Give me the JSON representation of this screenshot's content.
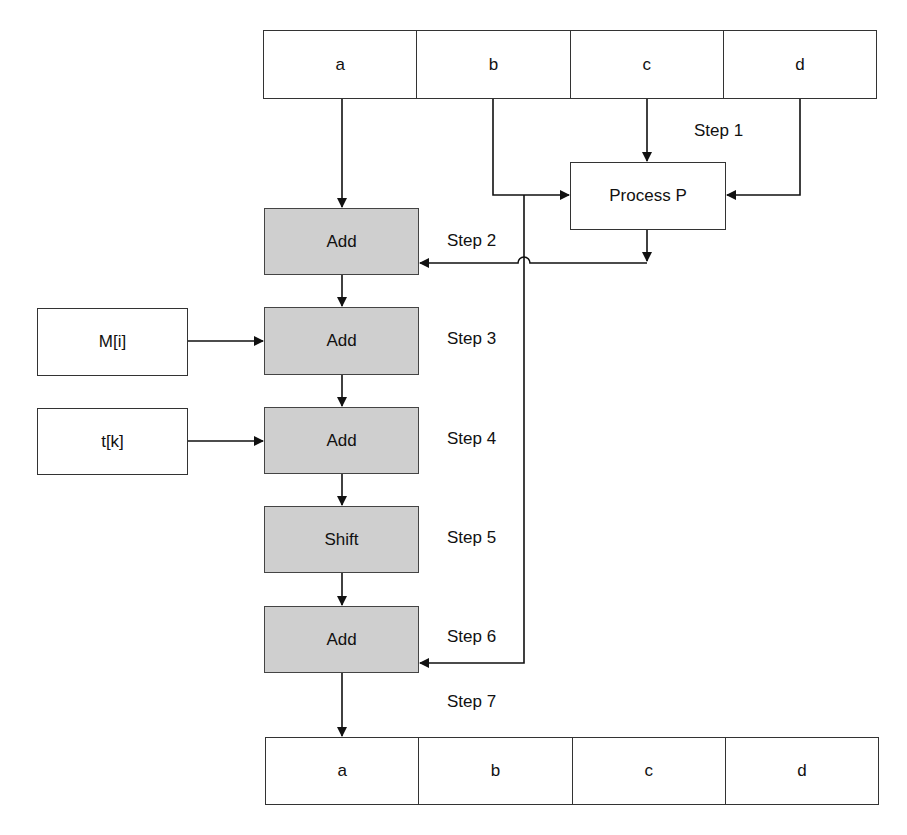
{
  "input_register": {
    "cells": [
      "a",
      "b",
      "c",
      "d"
    ]
  },
  "output_register": {
    "cells": [
      "a",
      "b",
      "c",
      "d"
    ]
  },
  "process_box": {
    "label": "Process P"
  },
  "operations": [
    {
      "label": "Add",
      "step": "Step 2"
    },
    {
      "label": "Add",
      "step": "Step 3"
    },
    {
      "label": "Add",
      "step": "Step 4"
    },
    {
      "label": "Shift",
      "step": "Step 5"
    },
    {
      "label": "Add",
      "step": "Step 6"
    }
  ],
  "side_inputs": [
    {
      "label": "M[i]",
      "feeds": "Step 3"
    },
    {
      "label": "t[k]",
      "feeds": "Step 4"
    }
  ],
  "steps": {
    "step1": "Step 1",
    "step7": "Step 7"
  },
  "colors": {
    "operation_fill": "#cfcfcf",
    "box_fill": "#ffffff",
    "line": "#111111"
  }
}
